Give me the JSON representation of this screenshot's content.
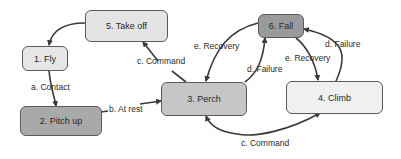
{
  "nodes": {
    "fly": {
      "label": "1. Fly",
      "color": "#e6e6e6"
    },
    "pitch_up": {
      "label": "2. Pitch up",
      "color": "#a9a9a9"
    },
    "perch": {
      "label": "3. Perch",
      "color": "#c6c6c6"
    },
    "climb": {
      "label": "4. Climb",
      "color": "#f0f0f0"
    },
    "take_off": {
      "label": "5. Take off",
      "color": "#e4e4e4"
    },
    "fall": {
      "label": "6. Fall",
      "color": "#9a9a9a"
    }
  },
  "edges": [
    {
      "from": "take_off",
      "to": "fly",
      "label": ""
    },
    {
      "from": "fly",
      "to": "pitch_up",
      "label": "a. Contact"
    },
    {
      "from": "pitch_up",
      "to": "perch",
      "label": "b. At rest"
    },
    {
      "from": "perch",
      "to": "take_off",
      "label": "c. Command"
    },
    {
      "from": "fall",
      "to": "perch",
      "label": "e. Recovery"
    },
    {
      "from": "perch",
      "to": "fall",
      "label": "d. Failure"
    },
    {
      "from": "fall",
      "to": "climb",
      "label": "e. Recovery"
    },
    {
      "from": "climb",
      "to": "fall",
      "label": "d. Failure"
    },
    {
      "from": "perch",
      "to": "climb",
      "label": "c. Command"
    }
  ],
  "edge_labels": {
    "contact": "a. Contact",
    "at_rest": "b. At rest",
    "command_takeoff": "c. Command",
    "recovery_perch": "e. Recovery",
    "failure_perch": "d. Failure",
    "recovery_climb": "e. Recovery",
    "failure_climb": "d. Failure",
    "command_climb": "c. Command"
  }
}
